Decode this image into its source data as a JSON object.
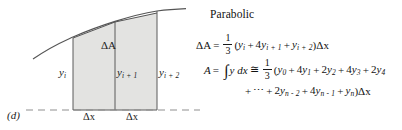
{
  "figure": {
    "panel_label": "(d)",
    "area_label": "ΔA",
    "ordinates": [
      {
        "base": "y",
        "sub": "i"
      },
      {
        "base": "y",
        "sub": "i + 1"
      },
      {
        "base": "y",
        "sub": "i + 2"
      }
    ],
    "width_labels": [
      "Δx",
      "Δx"
    ],
    "colors": {
      "shading": "#e2e2e0",
      "curve": "#4a4a4a",
      "chord": "#4a4a4a",
      "rule": "#5a5a5a",
      "baseline_dash": "#8a8a8a"
    }
  },
  "equations": {
    "title": "Parabolic",
    "delta_area": {
      "lhs": "ΔA",
      "relation": "=",
      "fraction": {
        "numerator": "1",
        "denominator": "3"
      },
      "open_paren": "(",
      "terms": [
        {
          "coef": "",
          "base": "y",
          "sub": "i"
        },
        {
          "coef": "4",
          "base": "y",
          "sub": "i + 1"
        },
        {
          "coef": "",
          "base": "y",
          "sub": "i + 2"
        }
      ],
      "close_paren": ")",
      "trailing": "Δx"
    },
    "total_area": {
      "lhs": "A",
      "relation_1": "=",
      "integral": "∫",
      "integrand": "y dx",
      "relation_2": "≅",
      "fraction": {
        "numerator": "1",
        "denominator": "3"
      },
      "open_paren": "(",
      "terms_line1": [
        {
          "coef": "",
          "base": "y",
          "sub": "0"
        },
        {
          "coef": "4",
          "base": "y",
          "sub": "1"
        },
        {
          "coef": "2",
          "base": "y",
          "sub": "2"
        },
        {
          "coef": "4",
          "base": "y",
          "sub": "3"
        },
        {
          "coef": "2",
          "base": "y",
          "sub": "4"
        }
      ],
      "ellipsis": "⋯",
      "terms_line2": [
        {
          "coef": "2",
          "base": "y",
          "sub": "n - 2"
        },
        {
          "coef": "4",
          "base": "y",
          "sub": "n - 1"
        },
        {
          "coef": "",
          "base": "y",
          "sub": "n"
        }
      ],
      "close_paren": ")",
      "trailing": "Δx"
    },
    "plus": "+"
  }
}
